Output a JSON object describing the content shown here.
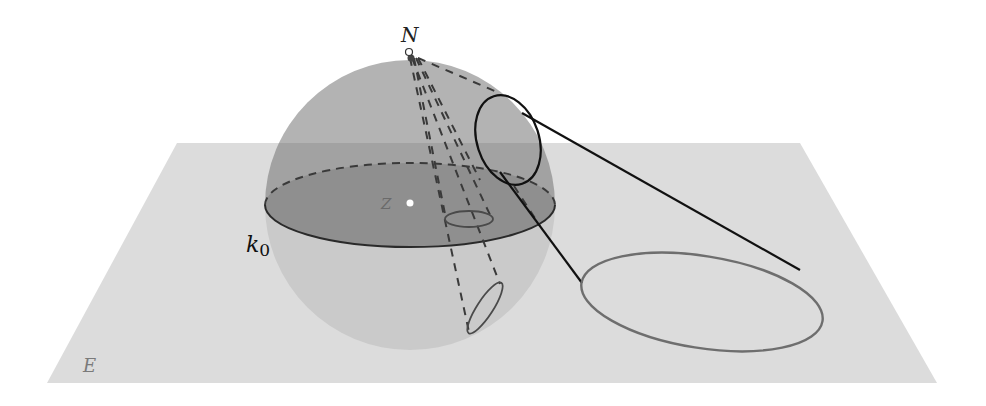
{
  "figure": {
    "labels": {
      "north_pole": "N",
      "equator": "k",
      "equator_subscript": "0",
      "plane": "E",
      "center": "Z"
    }
  },
  "colors": {
    "background": "#ffffff",
    "plane_fill": "#dcdcdc",
    "sphere_upper_fill": "#b3b3b3",
    "sphere_overlap_fill": "#9e9e9e",
    "sphere_lower_fill": "#cfcfcf",
    "equator_disk_fill": "#8f8f8f",
    "line_dark": "#1a1a1a",
    "line_mid": "#555555",
    "line_grey": "#6e6e6e"
  },
  "geometry": {
    "plane_corners": [
      [
        177,
        143
      ],
      [
        800,
        143
      ],
      [
        937,
        383
      ],
      [
        47,
        383
      ]
    ],
    "sphere_center": [
      410,
      203
    ],
    "sphere_radius": 145,
    "north_pole": [
      409,
      52
    ],
    "equator_ellipse": {
      "cx": 410,
      "cy": 205,
      "rx": 145,
      "ry": 42
    },
    "circle_on_sphere": {
      "cx": 510,
      "cy": 140,
      "rx": 32,
      "ry": 45,
      "rotate": -15
    },
    "projected_circle": {
      "cx": 700,
      "cy": 300,
      "rx": 122,
      "ry": 48,
      "rotate": 8
    },
    "small_ellipse_equator": {
      "cx": 469,
      "cy": 219,
      "rx": 24,
      "ry": 8
    },
    "small_ellipse_lower": {
      "cx": 485,
      "cy": 308,
      "rx": 30,
      "ry": 8,
      "rotate": -57
    }
  }
}
